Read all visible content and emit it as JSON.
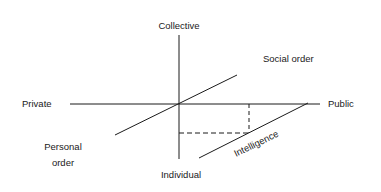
{
  "diagram": {
    "axes": {
      "vertical_top": "Collective",
      "vertical_bottom": "Individual",
      "horizontal_left": "Private",
      "horizontal_right": "Public"
    },
    "regions": {
      "upper_right": "Social order",
      "lower_left_line1": "Personal",
      "lower_left_line2": "order"
    },
    "line_label": "Intelligence"
  }
}
